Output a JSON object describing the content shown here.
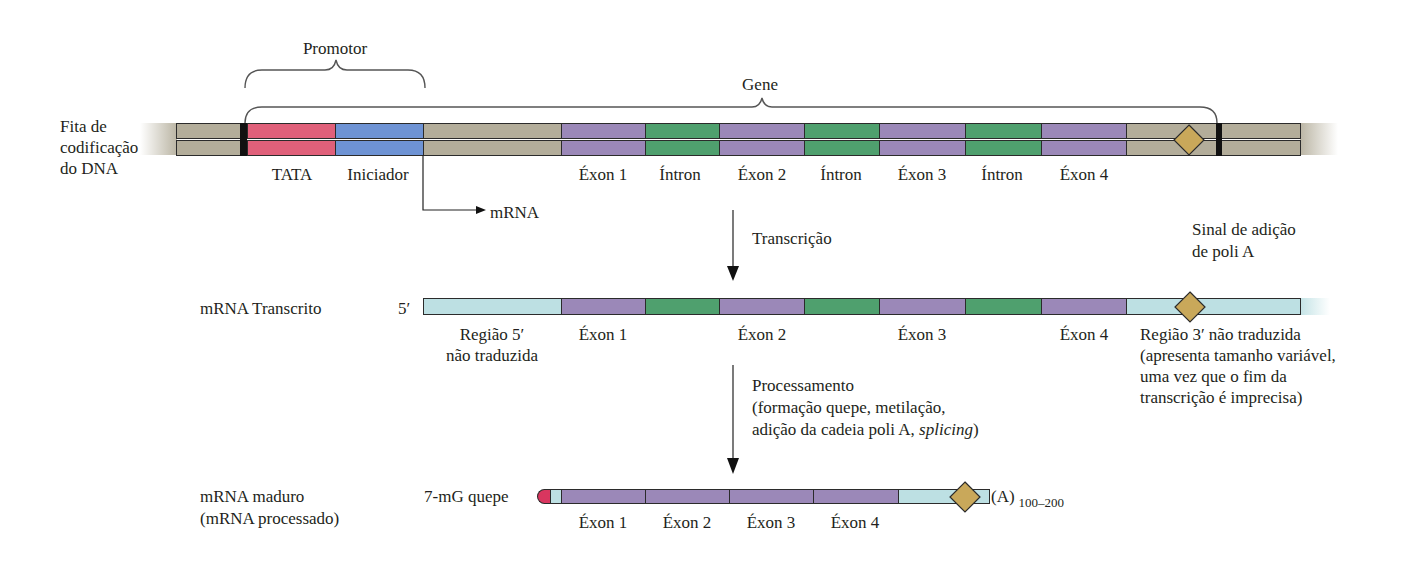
{
  "colors": {
    "tan": "#b3ad9a",
    "tata": "#e0607a",
    "initiator": "#6e93d4",
    "exon": "#9b88b8",
    "intron": "#4fa06e",
    "utr": "#bde0e3",
    "polyA_signal": "#c9a85a",
    "cap": "#d9365f",
    "black_bar": "#111111"
  },
  "dna": {
    "row_label": [
      "Fita de",
      "codificação",
      "do DNA"
    ],
    "promoter_label": "Promotor",
    "gene_label": "Gene",
    "segments": [
      {
        "type": "tan",
        "label": ""
      },
      {
        "type": "tata",
        "label": "TATA"
      },
      {
        "type": "initiator",
        "label": "Iniciador"
      },
      {
        "type": "tan",
        "label": ""
      },
      {
        "type": "exon",
        "label": "Éxon 1"
      },
      {
        "type": "intron",
        "label": "Íntron"
      },
      {
        "type": "exon",
        "label": "Éxon 2"
      },
      {
        "type": "intron",
        "label": "Íntron"
      },
      {
        "type": "exon",
        "label": "Éxon 3"
      },
      {
        "type": "intron",
        "label": "Íntron"
      },
      {
        "type": "exon",
        "label": "Éxon 4"
      },
      {
        "type": "tan",
        "label": ""
      },
      {
        "type": "tan",
        "label": ""
      }
    ],
    "start_arrow_label": "mRNA"
  },
  "step1": {
    "label": "Transcrição"
  },
  "transcript": {
    "row_label": "mRNA Transcrito",
    "five_prime": "5′",
    "utr5_label": [
      "Região 5′",
      "não traduzida"
    ],
    "exon_labels": [
      "Éxon 1",
      "Éxon 2",
      "Éxon 3",
      "Éxon 4"
    ],
    "utr3_label": [
      "Região 3′ não traduzida",
      "(apresenta tamanho variável,",
      "uma vez que o fim da",
      "transcrição é imprecisa)"
    ],
    "polyA_signal_label": [
      "Sinal de adição",
      "de poli A"
    ]
  },
  "step2": {
    "title": "Processamento",
    "detail_line1": "(formação quepe, metilação,",
    "detail_line2_prefix": "adição da cadeia poli A, ",
    "detail_line2_italic": "splicing",
    "detail_line2_suffix": ")"
  },
  "mature": {
    "row_label": [
      "mRNA maduro",
      "(mRNA processado)"
    ],
    "cap_label": "7-mG quepe",
    "exon_labels": [
      "Éxon 1",
      "Éxon 2",
      "Éxon 3",
      "Éxon 4"
    ],
    "polyA_tail": "(A)",
    "polyA_length": "100–200"
  }
}
